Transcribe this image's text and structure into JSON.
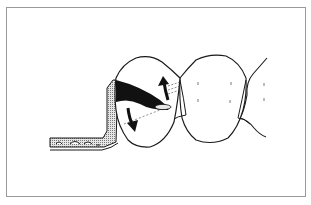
{
  "figure": {
    "description": "Dental illustration: matrix band with wedge around a molar crown, arrows showing rotation",
    "colors": {
      "frame": "#9a9a9a",
      "outline": "#1a1a1a",
      "hatch_fill": "#c8c8c8",
      "background": "#ffffff"
    },
    "elements": {
      "matrix_band": "matrix-band",
      "prepared_tooth": "prepared-tooth",
      "adjacent_tooth": "adjacent-tooth",
      "distal_tooth": "distal-tooth",
      "wedge": "wedge",
      "arrow_up": "arrow-up-icon",
      "arrow_down": "arrow-down-icon"
    }
  }
}
